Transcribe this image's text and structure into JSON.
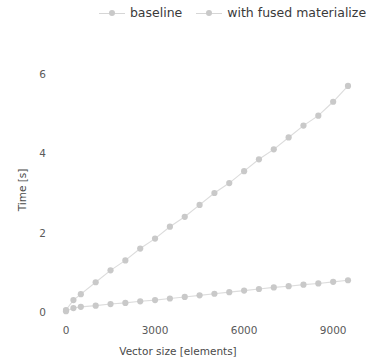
{
  "chart_data": {
    "type": "line",
    "title": "",
    "xlabel": "Vector size [elements]",
    "ylabel": "Time [s]",
    "xlim": [
      -400,
      9900
    ],
    "ylim": [
      -0.35,
      6.6
    ],
    "xticks": [
      0,
      3000,
      6000,
      9000
    ],
    "xtick_labels": [
      "0",
      "3000",
      "6000",
      "9000"
    ],
    "yticks": [
      0,
      2,
      4,
      6
    ],
    "ytick_labels": [
      "0",
      "2",
      "4",
      "6"
    ],
    "grid": false,
    "legend_position": "top-center",
    "marker": "circle",
    "colors": {
      "baseline": "#c9c9c9",
      "with_fused_materialize": "#c9c9c9",
      "line": "#dcdcdc",
      "text": "#3a3a3a"
    },
    "series": [
      {
        "name": "baseline",
        "x": [
          0,
          250,
          500,
          1000,
          1500,
          2000,
          2500,
          3000,
          3500,
          4000,
          4500,
          5000,
          5500,
          6000,
          6500,
          7000,
          7500,
          8000,
          8500,
          9000,
          9500
        ],
        "values": [
          0.05,
          0.3,
          0.45,
          0.75,
          1.05,
          1.3,
          1.6,
          1.85,
          2.15,
          2.4,
          2.7,
          3.0,
          3.25,
          3.55,
          3.85,
          4.1,
          4.4,
          4.7,
          4.95,
          5.3,
          5.7
        ]
      },
      {
        "name": "with fused materialize",
        "x": [
          0,
          250,
          500,
          1000,
          1500,
          2000,
          2500,
          3000,
          3500,
          4000,
          4500,
          5000,
          5500,
          6000,
          6500,
          7000,
          7500,
          8000,
          8500,
          9000,
          9500
        ],
        "values": [
          0.02,
          0.1,
          0.13,
          0.16,
          0.2,
          0.23,
          0.27,
          0.3,
          0.34,
          0.38,
          0.42,
          0.46,
          0.5,
          0.54,
          0.58,
          0.62,
          0.65,
          0.69,
          0.72,
          0.76,
          0.8
        ]
      }
    ]
  },
  "legend": {
    "entries": [
      {
        "label": "baseline"
      },
      {
        "label": "with fused materialize"
      }
    ]
  }
}
